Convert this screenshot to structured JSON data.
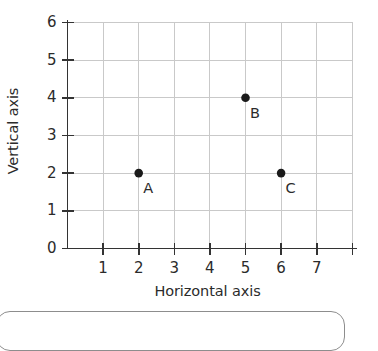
{
  "chart_data": {
    "type": "scatter",
    "title": "",
    "xlabel": "Horizontal axis",
    "ylabel": "Vertical axis",
    "xlim": [
      0,
      8
    ],
    "ylim": [
      0,
      6
    ],
    "grid": true,
    "legend": "none",
    "xticks": [
      1,
      2,
      3,
      4,
      5,
      6,
      7
    ],
    "xtick_labels": [
      "1",
      "2",
      "3",
      "4",
      "5",
      "6",
      "7"
    ],
    "yticks": [
      0,
      1,
      2,
      3,
      4,
      5,
      6
    ],
    "ytick_labels": [
      "0",
      "1",
      "2",
      "3",
      "4",
      "5",
      "6"
    ],
    "points": [
      {
        "label": "A",
        "x": 2,
        "y": 2
      },
      {
        "label": "B",
        "x": 5,
        "y": 4
      },
      {
        "label": "C",
        "x": 6,
        "y": 2
      }
    ],
    "marker_color": "#1a1a1a",
    "grid_color": "#c9c9c9",
    "axis_color": "#333333"
  },
  "colors": {
    "background": "#ffffff",
    "text": "#2b2b2b",
    "grid": "#c9c9c9",
    "axis": "#333333",
    "marker": "#1a1a1a",
    "panel_border": "#8d8d8d"
  }
}
